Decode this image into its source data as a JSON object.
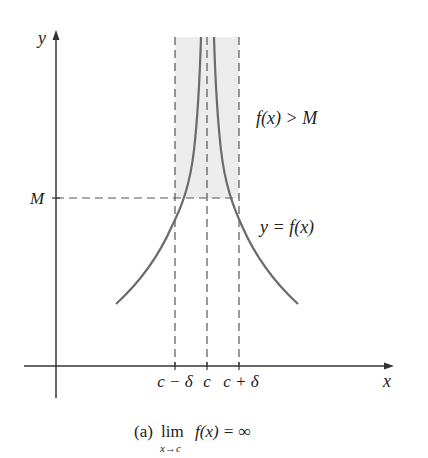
{
  "figure": {
    "caption_prefix": "(a)",
    "caption_lim": "lim",
    "caption_sub": "x→c",
    "caption_expr": "f(x) = ∞",
    "caption_full": "(a) lim_{x→c} f(x) = ∞"
  },
  "axes": {
    "x_label": "x",
    "y_label": "y"
  },
  "labels": {
    "M": "M",
    "region": "f(x) > M",
    "curve": "y = f(x)",
    "ticks": [
      "c − δ",
      "c",
      "c + δ"
    ]
  },
  "colors": {
    "axis": "#333333",
    "curve": "#6b6b6b",
    "dashed": "#555555",
    "shade": "#ececec",
    "text": "#222222"
  }
}
